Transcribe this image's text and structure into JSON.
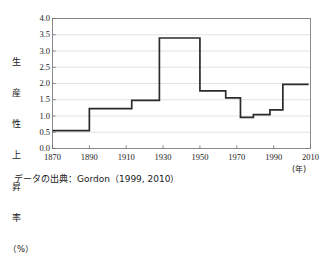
{
  "chart_data": {
    "type": "line",
    "subtype": "step",
    "title": "",
    "xlabel": "(年)",
    "ylabel": "生産性上昇率（%）",
    "ylabel_chars": [
      "生",
      "産",
      "性",
      "上",
      "昇",
      "率",
      "（%）"
    ],
    "xlim": [
      1870,
      2010
    ],
    "ylim": [
      0.0,
      4.0
    ],
    "grid": true,
    "grid_axis": "y",
    "legend": "none",
    "line_color": "#2b2b2b",
    "xticks": [
      1870,
      1890,
      1910,
      1930,
      1950,
      1970,
      1990,
      2010
    ],
    "xtick_labels": [
      "1870",
      "1890",
      "1910",
      "1930",
      "1950",
      "1970",
      "1990",
      "2010"
    ],
    "yticks": [
      0.0,
      0.5,
      1.0,
      1.5,
      2.0,
      2.5,
      3.0,
      3.5,
      4.0
    ],
    "ytick_labels": [
      "0.0",
      "0.5",
      "1.0",
      "1.5",
      "2.0",
      "2.5",
      "3.0",
      "3.5",
      "4.0"
    ],
    "segments": [
      {
        "start": 1870,
        "end": 1890,
        "value": 0.55
      },
      {
        "start": 1890,
        "end": 1913,
        "value": 1.23
      },
      {
        "start": 1913,
        "end": 1928,
        "value": 1.48
      },
      {
        "start": 1928,
        "end": 1950,
        "value": 3.4
      },
      {
        "start": 1950,
        "end": 1964,
        "value": 1.77
      },
      {
        "start": 1964,
        "end": 1972,
        "value": 1.56
      },
      {
        "start": 1972,
        "end": 1979,
        "value": 0.96
      },
      {
        "start": 1979,
        "end": 1988,
        "value": 1.04
      },
      {
        "start": 1988,
        "end": 1995,
        "value": 1.19
      },
      {
        "start": 1995,
        "end": 2009,
        "value": 1.97
      }
    ]
  },
  "caption": {
    "source_note": "データの出典：Gordon（1999, 2010）"
  },
  "axis": {
    "year_unit_label": "(年)"
  }
}
